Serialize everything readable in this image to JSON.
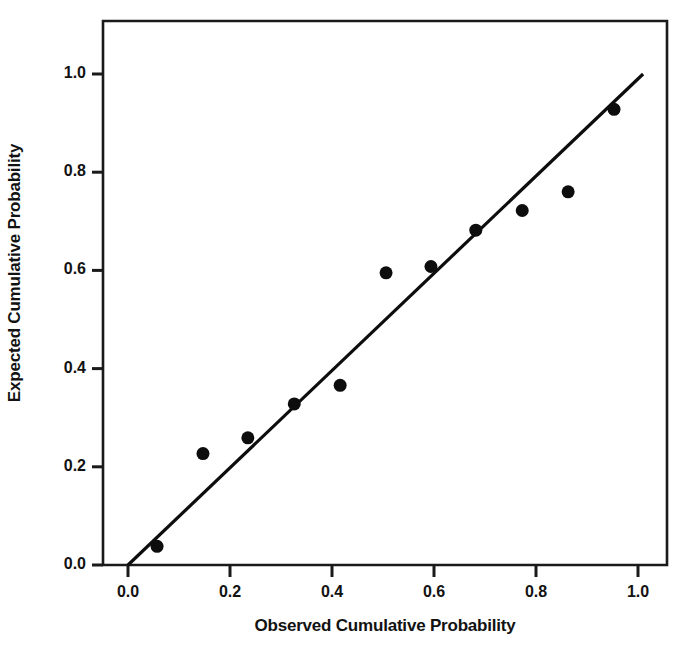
{
  "chart_data": {
    "type": "scatter",
    "title": "",
    "subtitle": "",
    "xlabel": "Observed Cumulative Probability",
    "ylabel": "Expected Cumulative Probability",
    "xlim": [
      -0.05,
      1.105
    ],
    "ylim": [
      -0.02,
      1.12
    ],
    "xticks": [
      "0.0",
      "0.2",
      "0.4",
      "0.6",
      "0.8",
      "1.0"
    ],
    "xtick_values": [
      0.0,
      0.2,
      0.4,
      0.6,
      0.8,
      1.0
    ],
    "yticks": [
      "0.0",
      "0.2",
      "0.4",
      "0.6",
      "0.8",
      "1.0"
    ],
    "ytick_values": [
      0.0,
      0.2,
      0.4,
      0.6,
      0.8,
      1.0
    ],
    "grid": false,
    "legend": null,
    "marker": "filled-circle",
    "marker_color": "#0d0d0d",
    "marker_size": 13,
    "line_color": "#0d0d0d",
    "frame_color": "#1a1a1a",
    "background": "#ffffff",
    "series": [
      {
        "name": "Observed vs Expected",
        "x": [
          0.057,
          0.147,
          0.235,
          0.326,
          0.416,
          0.506,
          0.594,
          0.682,
          0.773,
          0.863,
          0.953
        ],
        "y": [
          0.038,
          0.227,
          0.259,
          0.328,
          0.366,
          0.595,
          0.608,
          0.682,
          0.722,
          0.76,
          0.928
        ]
      }
    ],
    "reference_line": {
      "name": "diagonal reference line",
      "x": [
        0.0,
        1.01
      ],
      "y": [
        0.0,
        1.0
      ]
    }
  },
  "axes": {
    "y_title": "Expected Cumulative Probability",
    "x_title": "Observed Cumulative Probability"
  }
}
